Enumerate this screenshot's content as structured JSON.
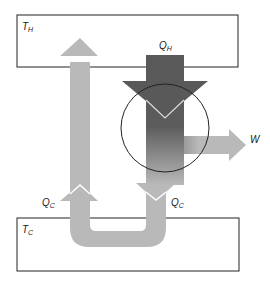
{
  "diagram": {
    "type": "heat-engine-energy-flow",
    "reservoirs": {
      "hot": {
        "label": "T",
        "subscript": "H"
      },
      "cold": {
        "label": "T",
        "subscript": "C"
      }
    },
    "flows": {
      "heat_in": {
        "label": "Q",
        "subscript": "H"
      },
      "heat_out_left": {
        "label": "Q",
        "subscript": "C"
      },
      "heat_out_right": {
        "label": "Q",
        "subscript": "C"
      },
      "work": {
        "label": "W"
      }
    },
    "colors": {
      "hot_arrow": "#595959",
      "cold_arrow": "#b9b9b9",
      "outline": "#222222",
      "background": "#ffffff"
    }
  }
}
